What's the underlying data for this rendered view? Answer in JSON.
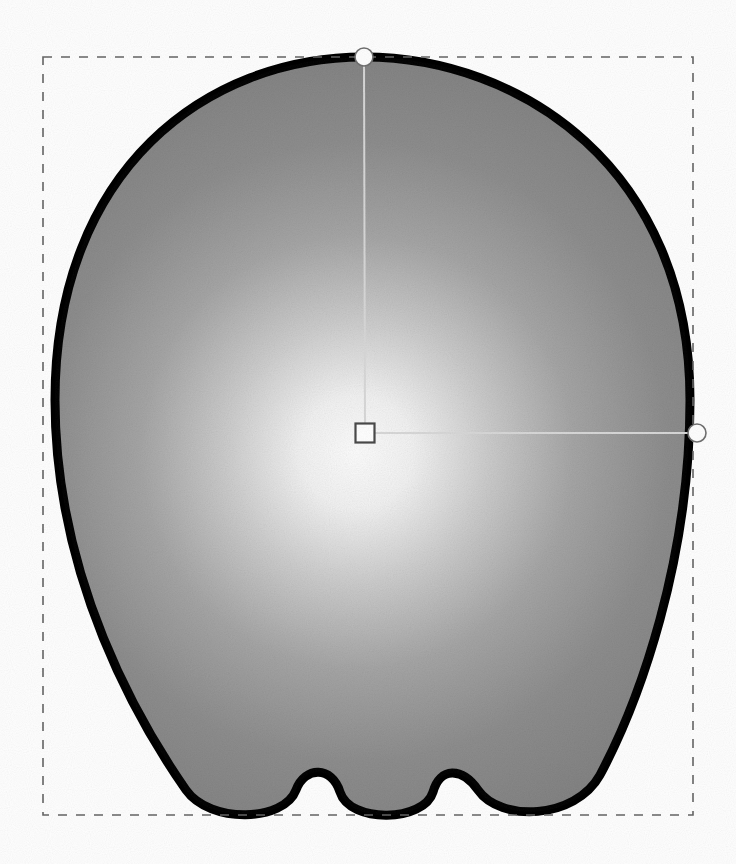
{
  "document": {
    "canvas_width": 736,
    "canvas_height": 864,
    "background_color": "#ffffff",
    "tool_state": "gradient-fill-editing",
    "object_label": "apple-silhouette-shape"
  },
  "selection": {
    "name": "selection-bounding-box",
    "style": "dashed",
    "stroke_color": "#666666",
    "stroke_width": 1.6,
    "dash_length": 9,
    "dash_gap": 9,
    "x": 43,
    "y": 57,
    "width": 650,
    "height": 758
  },
  "shape": {
    "name": "apple-silhouette",
    "outline_color": "#000000",
    "outline_width": 9,
    "fill_type": "radial-gradient",
    "path": "M 364 57 C 520 57 690 168 690 400 C 690 560 640 700 600 775 C 575 820 500 822 478 790 C 462 767 440 767 433 792 C 424 822 350 824 340 792 C 332 766 305 766 296 790 C 284 822 210 824 186 790 C 140 724 55 580 55 400 C 55 168 208 57 364 57 Z"
  },
  "gradient": {
    "name": "radial-gradient-fill",
    "type": "radial",
    "center_x": 357,
    "center_y": 452,
    "radius": 470,
    "stops": [
      {
        "offset": 0.0,
        "color": "#ffffff"
      },
      {
        "offset": 0.12,
        "color": "#f4f4f4"
      },
      {
        "offset": 0.28,
        "color": "#cdcdcd"
      },
      {
        "offset": 0.46,
        "color": "#a6a6a6"
      },
      {
        "offset": 0.66,
        "color": "#8d8d8d"
      },
      {
        "offset": 1.0,
        "color": "#7c7c7c"
      }
    ]
  },
  "handles": {
    "center": {
      "name": "gradient-center-handle",
      "kind": "square",
      "x": 365,
      "y": 433,
      "size": 19,
      "fill": "#ffffff",
      "stroke": "#4a4a4a",
      "stroke_width": 2.2
    },
    "focus_vertical": {
      "name": "gradient-radius-handle-vertical",
      "kind": "circle",
      "x": 364,
      "y": 57,
      "radius": 9,
      "fill": "#ffffff",
      "stroke": "#707070",
      "stroke_width": 1.6
    },
    "focus_horizontal": {
      "name": "gradient-radius-handle-horizontal",
      "kind": "circle",
      "x": 697,
      "y": 433,
      "radius": 9,
      "fill": "#ffffff",
      "stroke": "#707070",
      "stroke_width": 1.6
    },
    "connector_vertical": {
      "name": "gradient-axis-line-vertical",
      "x1": 364,
      "y1": 57,
      "x2": 365,
      "y2": 424,
      "stroke": "#d8d8d8",
      "stroke_width": 2
    },
    "connector_horizontal": {
      "name": "gradient-axis-line-horizontal",
      "x1": 375,
      "y1": 433,
      "x2": 690,
      "y2": 433,
      "stroke": "#d8d8d8",
      "stroke_width": 2
    }
  }
}
